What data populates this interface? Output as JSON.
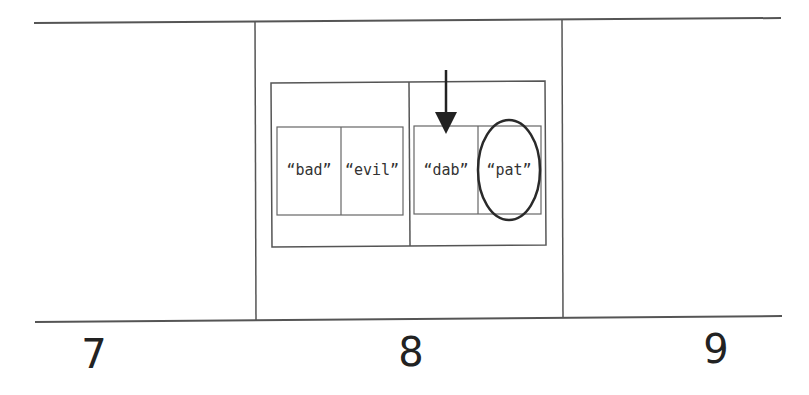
{
  "diagram": {
    "slots": [
      {
        "index": "7"
      },
      {
        "index": "8"
      },
      {
        "index": "9"
      }
    ],
    "groups": [
      {
        "items": [
          "“bad”",
          "“evil”"
        ]
      },
      {
        "items": [
          "“dab”",
          "“pat”"
        ]
      }
    ],
    "pointer": {
      "target": "“dab”",
      "icon": "down-arrow-icon"
    },
    "highlight": {
      "target": "“pat”",
      "icon": "ellipse-circle-icon"
    },
    "colors": {
      "line": "#444444",
      "text": "#333333",
      "background": "#ffffff"
    }
  }
}
